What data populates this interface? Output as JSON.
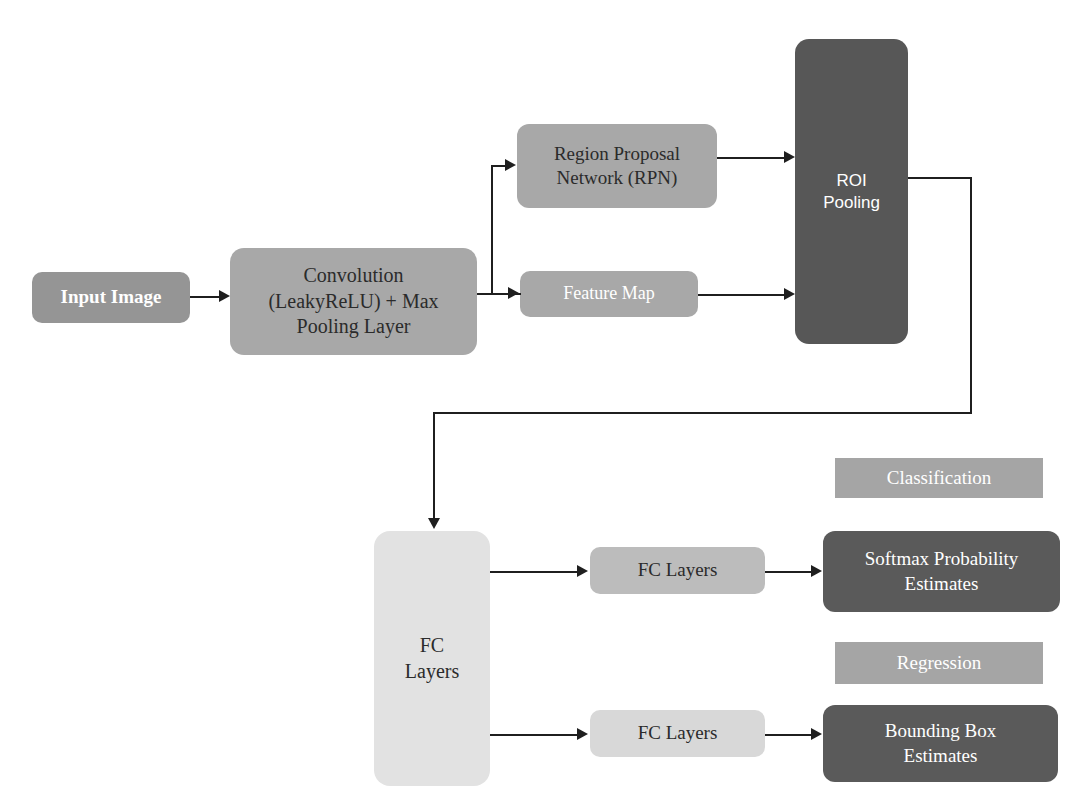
{
  "diagram": {
    "background_color": "#ffffff",
    "nodes": {
      "input_image": {
        "label": "Input Image",
        "color": "#959595",
        "text_color": "#ffffff"
      },
      "convolution": {
        "label": "Convolution\n(LeakyReLU) + Max\nPooling Layer",
        "color": "#a8a8a8",
        "text_color": "#2b2b2b"
      },
      "rpn": {
        "label": "Region Proposal\nNetwork (RPN)",
        "color": "#a8a8a8",
        "text_color": "#2b2b2b"
      },
      "feature_map": {
        "label": "Feature Map",
        "color": "#a8a8a8",
        "text_color": "#ffffff"
      },
      "roi_pooling": {
        "label": "ROI\nPooling",
        "color": "#575757",
        "text_color": "#ffffff"
      },
      "fc_layers_main": {
        "label": "FC\nLayers",
        "color": "#e2e2e2",
        "text_color": "#2b2b2b"
      },
      "fc_layers_top": {
        "label": "FC Layers",
        "color": "#bcbcbc",
        "text_color": "#2b2b2b"
      },
      "fc_layers_bottom": {
        "label": "FC Layers",
        "color": "#d8d8d8",
        "text_color": "#2b2b2b"
      },
      "classification": {
        "label": "Classification",
        "color": "#a5a5a5",
        "text_color": "#ffffff"
      },
      "softmax": {
        "label": "Softmax Probability\nEstimates",
        "color": "#5a5a5a",
        "text_color": "#ffffff"
      },
      "regression": {
        "label": "Regression",
        "color": "#a5a5a5",
        "text_color": "#ffffff"
      },
      "bounding_box": {
        "label": "Bounding Box\nEstimates",
        "color": "#5a5a5a",
        "text_color": "#ffffff"
      }
    },
    "edges": [
      {
        "from": "input_image",
        "to": "convolution"
      },
      {
        "from": "convolution",
        "to": "rpn"
      },
      {
        "from": "convolution",
        "to": "feature_map"
      },
      {
        "from": "rpn",
        "to": "roi_pooling"
      },
      {
        "from": "feature_map",
        "to": "roi_pooling"
      },
      {
        "from": "roi_pooling",
        "to": "fc_layers_main"
      },
      {
        "from": "fc_layers_main",
        "to": "fc_layers_top"
      },
      {
        "from": "fc_layers_main",
        "to": "fc_layers_bottom"
      },
      {
        "from": "fc_layers_top",
        "to": "softmax"
      },
      {
        "from": "fc_layers_bottom",
        "to": "bounding_box"
      }
    ],
    "edge_color": "#1f1f1f"
  }
}
